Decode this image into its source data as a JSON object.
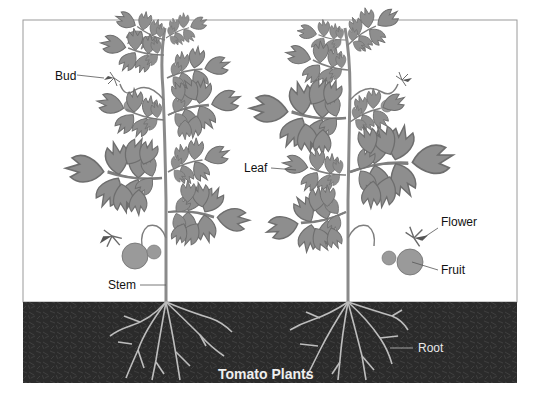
{
  "diagram": {
    "title": "Tomato Plants",
    "colors": {
      "background": "#ffffff",
      "frame": "#9a9a9a",
      "soil": "#2b2b2b",
      "soil_texture": "#3d3d3d",
      "leaf_fill": "#8e8e8e",
      "leaf_stroke": "#6e6e6e",
      "stem": "#8a8a8a",
      "root": "#bdbdbd",
      "fruit_fill": "#9a9a9a",
      "label_text": "#111111",
      "leader_line": "#555555",
      "title_text": "#efefef"
    },
    "labels": [
      {
        "id": "bud",
        "text": "Bud"
      },
      {
        "id": "leaf",
        "text": "Leaf"
      },
      {
        "id": "stem",
        "text": "Stem"
      },
      {
        "id": "flower",
        "text": "Flower"
      },
      {
        "id": "fruit",
        "text": "Fruit"
      },
      {
        "id": "root",
        "text": "Root"
      }
    ],
    "plants": [
      {
        "name": "left-plant"
      },
      {
        "name": "right-plant"
      }
    ]
  }
}
